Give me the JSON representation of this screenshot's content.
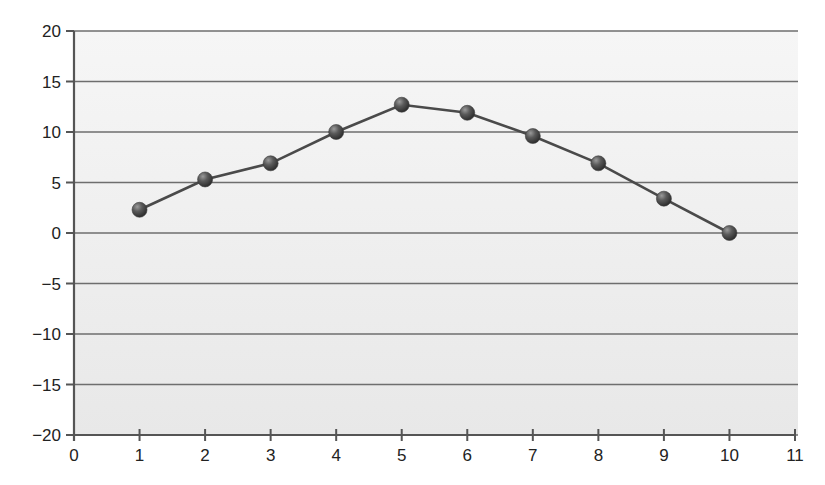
{
  "chart_data": {
    "type": "line",
    "title": "",
    "xlabel": "",
    "ylabel": "",
    "x": [
      1,
      2,
      3,
      4,
      5,
      6,
      7,
      8,
      9,
      10
    ],
    "series": [
      {
        "name": "series-1",
        "values": [
          2.3,
          5.3,
          6.9,
          10.0,
          12.7,
          11.9,
          9.6,
          6.9,
          3.4,
          0.0
        ]
      }
    ],
    "xlim": [
      0,
      11
    ],
    "ylim": [
      -20,
      20
    ],
    "x_ticks": [
      0,
      1,
      2,
      3,
      4,
      5,
      6,
      7,
      8,
      9,
      10,
      11
    ],
    "y_ticks": [
      20,
      15,
      10,
      5,
      0,
      -5,
      -10,
      -15,
      -20
    ],
    "y_tick_labels": [
      "20",
      "15",
      "10",
      "5",
      "0",
      "−5",
      "−10",
      "−15",
      "−20"
    ],
    "grid": {
      "horizontal": true,
      "vertical": false
    },
    "legend": null,
    "marker": "sphere"
  },
  "colors": {
    "line": "#4a4a4a",
    "grid": "#6e6e6e",
    "axis": "#555555",
    "plot_bg_top": "#f6f6f6",
    "plot_bg_bottom": "#e8e8e8",
    "marker_light": "#9a9a9a",
    "marker_dark": "#2e2e2e"
  }
}
